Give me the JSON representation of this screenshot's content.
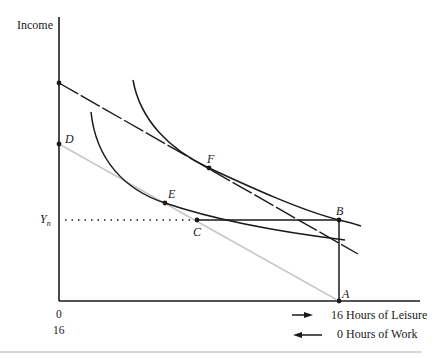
{
  "diagram": {
    "type": "labor-leisure budget constraint with indifference curves",
    "axes": {
      "y_label": "Income",
      "x_origin_top": "0",
      "x_origin_bottom": "16"
    },
    "points": {
      "A": "A",
      "B": "B",
      "C": "C",
      "D": "D",
      "E": "E",
      "F": "F"
    },
    "y_marker": {
      "main": "Y",
      "subscript": "n"
    },
    "legend": {
      "leisure": "16 Hours of Leisure",
      "work": "0 Hours of Work"
    },
    "colors": {
      "ink": "#1a1a1a",
      "grey_budget_line": "#c8c8c8",
      "separator": "#d9d9d9"
    }
  }
}
